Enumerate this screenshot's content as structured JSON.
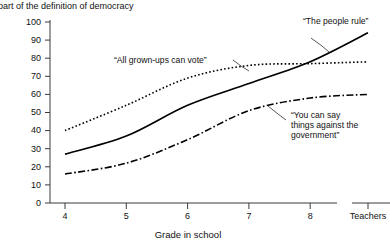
{
  "subtitle": "part of the definition of democracy",
  "axes": {
    "xlabel": "Grade in school",
    "ylabel": "",
    "ytick_labels": [
      "0",
      "10",
      "20",
      "30",
      "40",
      "50",
      "60",
      "70",
      "80",
      "90",
      "100"
    ],
    "xtick_labels": [
      "4",
      "5",
      "6",
      "7",
      "8"
    ],
    "extra_xtick_label": "Teachers"
  },
  "annotations": {
    "people_rule": "“The people rule”",
    "grown_ups_vote": "“All grown-ups can vote”",
    "say_things_line1": "“You can say",
    "say_things_line2": "things against the",
    "say_things_line3": "government”"
  },
  "chart_data": {
    "type": "line",
    "title": "",
    "subtitle": "part of the definition of democracy",
    "xlabel": "Grade in school",
    "ylabel": "",
    "categories": [
      "4",
      "5",
      "6",
      "7",
      "8",
      "Teachers"
    ],
    "ylim": [
      0,
      100
    ],
    "ytick_step": 10,
    "grid": false,
    "legend": "inline-annotations",
    "series": [
      {
        "name": "“All grown-ups can vote”",
        "style": "dotted",
        "values": [
          40,
          54,
          69,
          76,
          77,
          78
        ]
      },
      {
        "name": "“The people rule”",
        "style": "solid",
        "values": [
          27,
          37,
          54,
          66,
          78,
          94
        ]
      },
      {
        "name": "“You can say things against the government”",
        "style": "dash-dot",
        "values": [
          16,
          22,
          35,
          51,
          58,
          60
        ]
      }
    ]
  },
  "colors": {
    "line": "#000000",
    "axis": "#3a3a3a",
    "text": "#111111",
    "background": "#ffffff"
  }
}
